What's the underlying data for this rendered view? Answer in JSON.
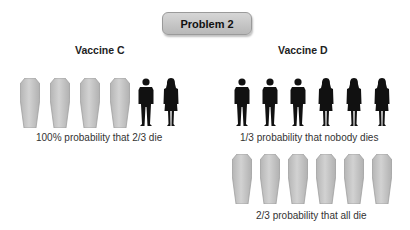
{
  "badge": {
    "label": "Problem 2"
  },
  "vaccine_c": {
    "title": "Vaccine C",
    "row": [
      "coffin-icon",
      "coffin-icon",
      "coffin-icon",
      "coffin-icon",
      "man-icon",
      "woman-icon"
    ],
    "caption": "100% probability that 2/3 die"
  },
  "vaccine_d": {
    "title": "Vaccine D",
    "row1": [
      "man-icon",
      "man-icon",
      "man-icon",
      "woman-icon",
      "woman-icon",
      "woman-icon"
    ],
    "caption1": "1/3 probability that nobody dies",
    "row2": [
      "coffin-icon",
      "coffin-icon",
      "coffin-icon",
      "coffin-icon",
      "coffin-icon",
      "coffin-icon"
    ],
    "caption2": "2/3 probability that all die"
  },
  "colors": {
    "coffin_fill": "#c4c4c4",
    "coffin_edge": "#a8a8a8",
    "person": "#111111",
    "badge": "#c8c8c8"
  }
}
